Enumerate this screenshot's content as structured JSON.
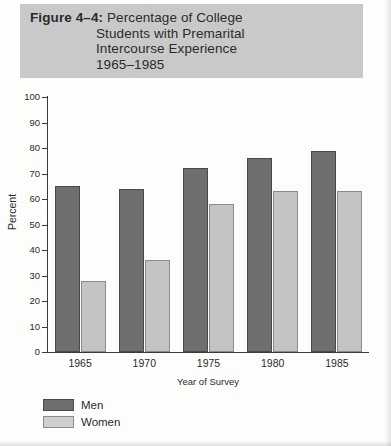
{
  "figure": {
    "label": "Figure 4–4:",
    "title_lines": [
      "Percentage of College",
      "Students with Premarital",
      "Intercourse Experience",
      "1965–1985"
    ],
    "banner_color": "#c9c9c9"
  },
  "chart_data": {
    "type": "bar",
    "title": "Figure 4–4: Percentage of College Students with Premarital Intercourse Experience 1965–1985",
    "categories": [
      "1965",
      "1970",
      "1975",
      "1980",
      "1985"
    ],
    "series": [
      {
        "name": "Men",
        "color": "#6e6e6e",
        "values": [
          65,
          64,
          72,
          76,
          79
        ]
      },
      {
        "name": "Women",
        "color": "#c4c4c4",
        "values": [
          28,
          36,
          58,
          63,
          63
        ]
      }
    ],
    "xlabel": "Year of Survey",
    "ylabel": "Percent",
    "ylim": [
      0,
      100
    ],
    "yticks": [
      0,
      10,
      20,
      30,
      40,
      50,
      60,
      70,
      80,
      90,
      100
    ],
    "ytick_labels": [
      "0",
      "10",
      "20",
      "30",
      "40",
      "50",
      "60",
      "70",
      "80",
      "90",
      "100"
    ],
    "grid": false,
    "legend_position": "bottom-left"
  }
}
